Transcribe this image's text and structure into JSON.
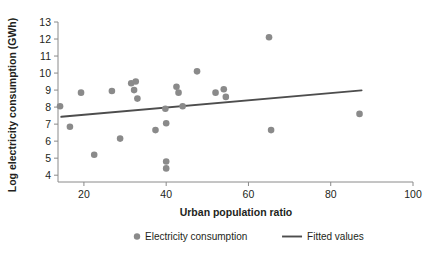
{
  "chart_data": {
    "type": "scatter",
    "title": "",
    "xlabel": "Urban population ratio",
    "ylabel": "Log electricity consumption (GWh)",
    "xlim": [
      13.7,
      100
    ],
    "ylim": [
      3.6,
      13
    ],
    "xticks": [
      20,
      40,
      60,
      80,
      100
    ],
    "yticks": [
      4,
      5,
      6,
      7,
      8,
      9,
      10,
      11,
      12,
      13
    ],
    "grid": false,
    "legend_position": "bottom",
    "marker_color": "#8a8a8a",
    "line_color": "#4d4d4d",
    "axis_color": "#8a8a8a",
    "series": [
      {
        "name": "Electricity consumption",
        "type": "scatter",
        "points": [
          {
            "x": 14.2,
            "y": 8.05
          },
          {
            "x": 16.6,
            "y": 6.85
          },
          {
            "x": 19.3,
            "y": 8.85
          },
          {
            "x": 22.5,
            "y": 5.2
          },
          {
            "x": 26.8,
            "y": 8.95
          },
          {
            "x": 28.8,
            "y": 6.15
          },
          {
            "x": 31.5,
            "y": 9.4
          },
          {
            "x": 32.6,
            "y": 9.5
          },
          {
            "x": 32.2,
            "y": 9.0
          },
          {
            "x": 33.0,
            "y": 8.5
          },
          {
            "x": 37.4,
            "y": 6.65
          },
          {
            "x": 39.8,
            "y": 7.9
          },
          {
            "x": 40.0,
            "y": 7.05
          },
          {
            "x": 40.0,
            "y": 4.8
          },
          {
            "x": 40.0,
            "y": 4.4
          },
          {
            "x": 42.5,
            "y": 9.2
          },
          {
            "x": 43.0,
            "y": 8.85
          },
          {
            "x": 44.0,
            "y": 8.05
          },
          {
            "x": 47.5,
            "y": 10.1
          },
          {
            "x": 52.0,
            "y": 8.85
          },
          {
            "x": 54.0,
            "y": 9.05
          },
          {
            "x": 54.5,
            "y": 8.6
          },
          {
            "x": 65.0,
            "y": 12.1
          },
          {
            "x": 65.5,
            "y": 6.65
          },
          {
            "x": 87.0,
            "y": 7.6
          }
        ]
      },
      {
        "name": "Fitted values",
        "type": "line",
        "points": [
          {
            "x": 14.5,
            "y": 7.43
          },
          {
            "x": 87.5,
            "y": 8.98
          }
        ]
      }
    ]
  },
  "legend": {
    "items": [
      {
        "label": "Electricity consumption",
        "marker": "dot",
        "color": "#8a8a8a"
      },
      {
        "label": "Fitted values",
        "marker": "line",
        "color": "#4d4d4d"
      }
    ]
  }
}
